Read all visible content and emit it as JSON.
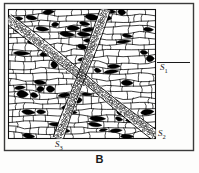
{
  "figure": {
    "panel_label": "B",
    "caption_note": "",
    "frame": {
      "outer_rect": [
        4,
        3,
        190,
        148
      ],
      "inner_rect": [
        8,
        9,
        148,
        130
      ]
    },
    "colors": {
      "ink": "#000000",
      "paper": "#fdfdfc",
      "grain_fill": "#ffffff",
      "opaque_fill": "#000000",
      "frame": "#3a3a3a"
    },
    "annotations": [
      {
        "id": "s1",
        "label": "S",
        "subscript": "1",
        "kind": "foliation-trace",
        "position": [
          160,
          63
        ],
        "tick_line": {
          "x1": 157,
          "y1": 62,
          "x2": 190,
          "y2": 62
        },
        "description": "horizontal reference line for S1 foliation"
      },
      {
        "id": "s2",
        "label": "S",
        "subscript": "2",
        "kind": "shear-band",
        "position": [
          158,
          129
        ],
        "description": "shear band exiting lower right corner"
      },
      {
        "id": "s3",
        "label": "S",
        "subscript": "3",
        "kind": "shear-band",
        "position": [
          55,
          140
        ],
        "description": "shear band exiting bottom edge left of centre"
      }
    ],
    "fabric": {
      "type": "mylonitic-crenulated-fabric",
      "matrix_description": "anastomosing elongate polygonal grains defining subhorizontal S1 foliation",
      "opaque_lens_count": 58,
      "grain_row_count": 22,
      "bands": [
        {
          "id": "band-s2",
          "from": [
            8,
            18
          ],
          "to": [
            156,
            136
          ],
          "width": 9,
          "texture": "fine granular / stippled microbreccia"
        },
        {
          "id": "band-s3",
          "from": [
            106,
            9
          ],
          "to": [
            58,
            139
          ],
          "width": 9,
          "texture": "fine granular / stippled microbreccia"
        }
      ]
    }
  }
}
